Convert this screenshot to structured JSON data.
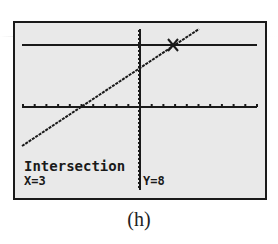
{
  "screen": {
    "background": "#e9e9e9",
    "ink": "#1a1a1a",
    "readout_title": "Intersection",
    "readout_x": "X=3",
    "readout_y": "Y=8"
  },
  "caption": "(h)",
  "chart_data": {
    "type": "line",
    "title": "Intersection",
    "xlabel": "",
    "ylabel": "",
    "grid": false,
    "axes_ticks": true,
    "series": [
      {
        "name": "sloped line",
        "description": "increasing line crossing the x-axis left of the origin"
      },
      {
        "name": "horizontal line",
        "description": "horizontal line y = 8"
      }
    ],
    "intersection": {
      "x": 3,
      "y": 8
    },
    "annotations": [
      "Intersection",
      "X=3",
      "Y=8"
    ],
    "pixel_geometry": {
      "x_axis_y": 107,
      "y_axis_x": 140,
      "horizontal_line_y": 45,
      "sloped_line": [
        [
          22,
          146
        ],
        [
          199,
          29
        ]
      ],
      "intersection_marker": [
        173,
        45
      ],
      "x_tick_spacing": 11.7
    }
  }
}
